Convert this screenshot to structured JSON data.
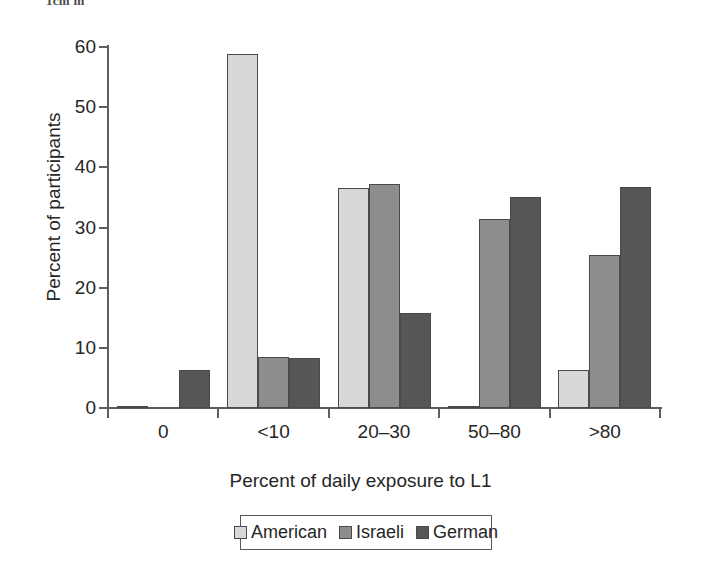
{
  "scan_fragment": "1cm m",
  "chart_data": {
    "type": "bar",
    "title": "",
    "xlabel": "Percent of daily exposure to L1",
    "ylabel": "Percent of participants",
    "categories": [
      "0",
      "<10",
      "20–30",
      "50–80",
      ">80"
    ],
    "series": [
      {
        "name": "American",
        "color": "#d8d8d8",
        "values": [
          0.3,
          58.9,
          36.6,
          0.3,
          6.4
        ]
      },
      {
        "name": "Israeli",
        "color": "#8d8d8d",
        "values": [
          0.0,
          8.5,
          37.2,
          31.4,
          25.4
        ]
      },
      {
        "name": "German",
        "color": "#565656",
        "values": [
          6.3,
          8.3,
          15.8,
          35.1,
          36.7
        ]
      }
    ],
    "ylim": [
      0,
      60
    ],
    "yticks": [
      0,
      10,
      20,
      30,
      40,
      50,
      60
    ],
    "ytick_labels": [
      "0",
      "10",
      "20",
      "30",
      "40",
      "50",
      "60"
    ],
    "grid": false,
    "legend_position": "bottom"
  }
}
